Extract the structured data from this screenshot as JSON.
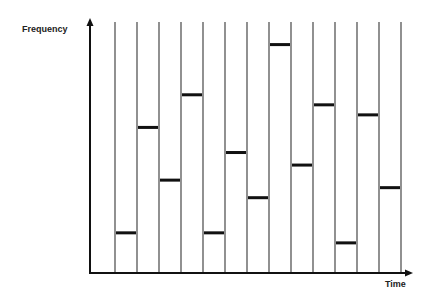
{
  "chart_data": {
    "type": "bar",
    "title": "",
    "xlabel": "Time",
    "ylabel": "Frequency",
    "grid": false,
    "legend": null,
    "ylim": [
      0,
      100
    ],
    "categories": [
      "t1",
      "t2",
      "t3",
      "t4",
      "t5",
      "t6",
      "t7",
      "t8",
      "t9",
      "t10",
      "t11",
      "t12",
      "t13"
    ],
    "values": [
      16,
      58,
      37,
      71,
      16,
      48,
      30,
      91,
      43,
      67,
      12,
      63,
      34
    ],
    "colors": {
      "axis": "#111111",
      "divider": "#555555",
      "bar": "#111111"
    }
  },
  "labels": {
    "y_axis": "Frequency",
    "x_axis": "Time"
  }
}
